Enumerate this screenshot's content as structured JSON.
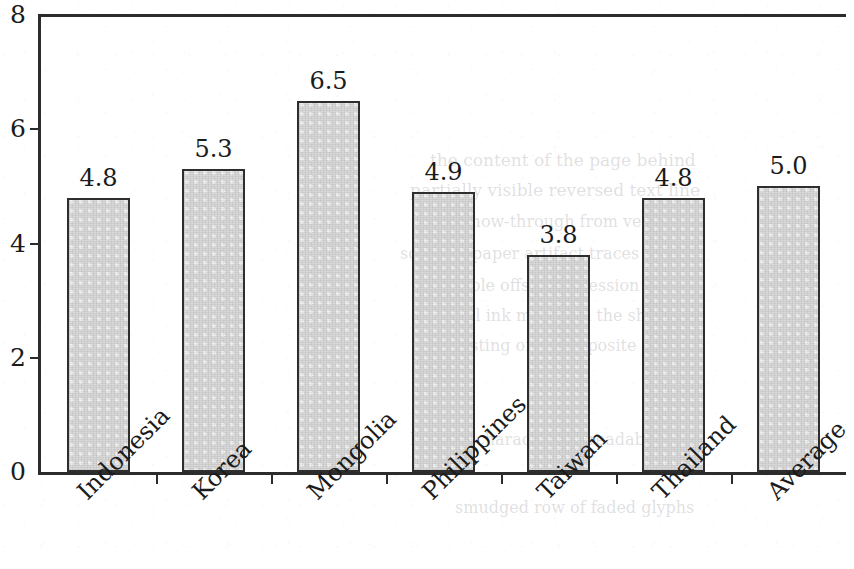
{
  "chart_data": {
    "type": "bar",
    "title": "",
    "subtitle": "",
    "xlabel": "",
    "ylabel": "",
    "categories": [
      "Indonesia",
      "Korea",
      "Mongolia",
      "Philippines",
      "Taiwan",
      "Thailand",
      "Average"
    ],
    "values": [
      4.8,
      5.3,
      6.5,
      4.9,
      3.8,
      4.8,
      5.0
    ],
    "value_labels": [
      "4.8",
      "5.3",
      "6.5",
      "4.9",
      "3.8",
      "4.8",
      "5.0"
    ],
    "ylim": [
      0,
      8
    ],
    "yticks": [
      0,
      2,
      4,
      6,
      8
    ],
    "ytick_labels": [
      "0",
      "2",
      "4",
      "6",
      "8"
    ],
    "grid": false,
    "legend": null,
    "bar_fill_color": "#d9d9d9",
    "bar_edge_color": "#2e2e2e",
    "axis_color": "#2c2c2c",
    "text_color": "#1b1b1b",
    "xtick_label_rotation": -45
  },
  "background_bleed": [
    {
      "text": "the  content  of  the  page  behind",
      "x": 430,
      "y": 150,
      "size": 17
    },
    {
      "text": "partially  visible  reversed  text  line",
      "x": 410,
      "y": 180,
      "size": 17
    },
    {
      "text": "faint  show-through  from  verso",
      "x": 420,
      "y": 212,
      "size": 16
    },
    {
      "text": "scanned  paper  artifact  traces",
      "x": 400,
      "y": 244,
      "size": 16
    },
    {
      "text": "illegible  offset  impression  here",
      "x": 430,
      "y": 276,
      "size": 16
    },
    {
      "text": "residual  ink  marks  on  the  sheet",
      "x": 415,
      "y": 306,
      "size": 16
    },
    {
      "text": "ghosting  of  the  opposite  side",
      "x": 440,
      "y": 336,
      "size": 16
    },
    {
      "text": "blurred  characters  unreadable",
      "x": 410,
      "y": 430,
      "size": 16
    },
    {
      "text": "smudged  row  of  faded  glyphs",
      "x": 455,
      "y": 498,
      "size": 16
    }
  ]
}
